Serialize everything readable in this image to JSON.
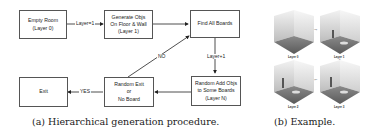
{
  "flowchart": {
    "nodes": {
      "empty_room": "Empty Room\n(Layer 0)",
      "generate_objs": "Generate Objs\nOn Floor & Wall\n(Layer 1)",
      "find_boards": "Find All Boards",
      "random_add": "Random Add Objs\nto Some Boards\n(Layer N)",
      "random_exit": "Random Exit\nor\nNo Board",
      "exit": "Exit"
    },
    "edges": {
      "layer_eq_1": "Layer=1",
      "layer_plus_1": "Layer+1",
      "no": "NO",
      "yes": "YES"
    }
  },
  "example": {
    "panels": [
      {
        "label": "Layer 0"
      },
      {
        "label": "Layer 1"
      },
      {
        "label": "Layer 2"
      },
      {
        "label": "Layer 3"
      }
    ]
  },
  "captions": {
    "a": "(a) Hierarchical generation procedure.",
    "b": "(b) Example."
  },
  "colors": {
    "box_border": "#555555",
    "arrow": "#222222",
    "text": "#222222"
  }
}
